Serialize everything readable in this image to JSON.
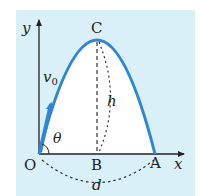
{
  "diagram": {
    "type": "projectile-motion",
    "labels": {
      "y_axis": "y",
      "x_axis": "x",
      "origin": "O",
      "apex": "C",
      "foot": "B",
      "landing": "A",
      "velocity": "v",
      "velocity_sub": "0",
      "angle": "θ",
      "height": "h",
      "distance": "d"
    },
    "colors": {
      "panel_bg": "#d9f0f8",
      "trajectory": "#2f86d6",
      "axes": "#222222",
      "dashed": "#333333",
      "fill_under_curve": "#ffffff"
    }
  }
}
